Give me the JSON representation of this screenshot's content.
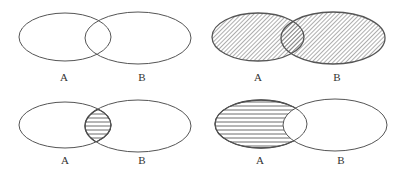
{
  "figure": {
    "colors": {
      "background": "#ffffff",
      "outline": "#555555",
      "hatch": "#555555"
    },
    "panels": [
      {
        "id": "plain",
        "position": "top-left",
        "shaded_region": "none",
        "hatch_style": "none",
        "sets": [
          {
            "label": "A",
            "cx": 65,
            "cy": 37,
            "rx": 46,
            "ry": 24
          },
          {
            "label": "B",
            "cx": 138,
            "cy": 38,
            "rx": 53,
            "ry": 26
          }
        ],
        "labels": [
          {
            "text": "A",
            "x": 64,
            "y": 77
          },
          {
            "text": "B",
            "x": 142,
            "y": 77
          }
        ]
      },
      {
        "id": "union",
        "position": "top-right",
        "shaded_region": "A ∪ B",
        "hatch_style": "diagonal",
        "sets": [
          {
            "label": "A",
            "cx": 258,
            "cy": 37,
            "rx": 46,
            "ry": 24
          },
          {
            "label": "B",
            "cx": 333,
            "cy": 38,
            "rx": 52,
            "ry": 26
          }
        ],
        "labels": [
          {
            "text": "A",
            "x": 258,
            "y": 77
          },
          {
            "text": "B",
            "x": 337,
            "y": 77
          }
        ]
      },
      {
        "id": "intersection",
        "position": "bottom-left",
        "shaded_region": "A ∩ B",
        "hatch_style": "horizontal",
        "sets": [
          {
            "label": "A",
            "cx": 65,
            "cy": 125,
            "rx": 46,
            "ry": 23
          },
          {
            "label": "B",
            "cx": 138,
            "cy": 126,
            "rx": 53,
            "ry": 26
          }
        ],
        "labels": [
          {
            "text": "A",
            "x": 65,
            "y": 160
          },
          {
            "text": "B",
            "x": 142,
            "y": 160
          }
        ]
      },
      {
        "id": "difference",
        "position": "bottom-right",
        "shaded_region": "A − B",
        "hatch_style": "horizontal",
        "sets": [
          {
            "label": "A",
            "cx": 261,
            "cy": 124,
            "rx": 46,
            "ry": 24
          },
          {
            "label": "B",
            "cx": 335,
            "cy": 125,
            "rx": 52,
            "ry": 26
          }
        ],
        "labels": [
          {
            "text": "A",
            "x": 260,
            "y": 160
          },
          {
            "text": "B",
            "x": 341,
            "y": 160
          }
        ]
      }
    ]
  }
}
